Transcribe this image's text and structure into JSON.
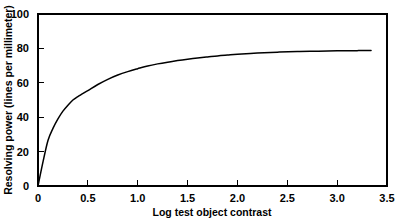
{
  "chart_data": {
    "type": "line",
    "title": "",
    "xlabel": "Log test object contrast",
    "ylabel": "Resolving power (lines per millimeter)",
    "xlim": [
      0,
      3.5
    ],
    "ylim": [
      0,
      100
    ],
    "grid": false,
    "legend": null,
    "xticks": [
      0,
      0.5,
      1.0,
      1.5,
      2.0,
      2.5,
      3.0,
      3.5
    ],
    "xtick_labels": [
      "0",
      "0.5",
      "1.0",
      "1.5",
      "2.0",
      "2.5",
      "3.0",
      "3.5"
    ],
    "yticks": [
      0,
      20,
      40,
      60,
      80,
      100
    ],
    "ytick_labels": [
      "0",
      "20",
      "40",
      "60",
      "80",
      "100"
    ],
    "series": [
      {
        "name": "resolving power",
        "color": "#000000",
        "x": [
          0.0,
          0.05,
          0.1,
          0.15,
          0.2,
          0.25,
          0.3,
          0.35,
          0.4,
          0.5,
          0.6,
          0.7,
          0.8,
          0.9,
          1.0,
          1.1,
          1.2,
          1.3,
          1.4,
          1.5,
          1.6,
          1.7,
          1.8,
          1.9,
          2.0,
          2.2,
          2.4,
          2.6,
          2.8,
          3.0,
          3.2,
          3.34
        ],
        "y": [
          0.0,
          14.0,
          26.5,
          33.5,
          39.0,
          43.5,
          47.0,
          50.0,
          52.0,
          55.5,
          59.0,
          62.0,
          64.5,
          66.5,
          68.2,
          69.8,
          71.0,
          72.0,
          72.9,
          73.7,
          74.4,
          75.0,
          75.6,
          76.1,
          76.6,
          77.3,
          77.8,
          78.2,
          78.4,
          78.6,
          78.7,
          78.8
        ]
      }
    ]
  },
  "axis": {
    "x_label": "Log test object contrast",
    "y_label": "Resolving power (lines per millimeter)"
  }
}
